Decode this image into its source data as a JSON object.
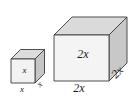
{
  "figure": {
    "type": "geometry-diagram",
    "background_color": "#ffffff",
    "shapes": [
      {
        "id": "small-cube",
        "name": "small-cube",
        "edge_expression": "x",
        "labels": {
          "front_vertical": "x",
          "bottom_front": "x",
          "right_depth": "x"
        },
        "faces": {
          "front_color": "#f2f2f2",
          "top_color": "#dcdcdc",
          "right_color": "#c6c6c6",
          "outline_color": "#3c3c3c"
        }
      },
      {
        "id": "large-cube",
        "name": "large-cube",
        "edge_expression": "2x",
        "labels": {
          "front_vertical": "2x",
          "bottom_front": "2x",
          "right_depth": "2x"
        },
        "faces": {
          "front_color": "#f4f4f4",
          "top_color": "#dadada",
          "right_color": "#c8c8c8",
          "outline_color": "#3c3c3c"
        }
      }
    ]
  }
}
